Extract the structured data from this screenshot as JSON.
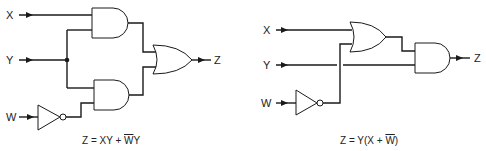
{
  "left_circuit": {
    "inputs": {
      "x": "X",
      "y": "Y",
      "w": "W"
    },
    "output": "Z",
    "gates": [
      "AND",
      "AND",
      "NOT",
      "OR"
    ],
    "formula": {
      "prefix": "Z = XY + ",
      "bar": "W",
      "suffix": "Y"
    }
  },
  "right_circuit": {
    "inputs": {
      "x": "X",
      "y": "Y",
      "w": "W"
    },
    "output": "Z",
    "gates": [
      "OR",
      "NOT",
      "AND"
    ],
    "formula": {
      "prefix": "Z = Y(X + ",
      "bar": "W",
      "suffix": ")"
    }
  },
  "colors": {
    "line": "#1a1a1a",
    "background": "#ffffff"
  }
}
